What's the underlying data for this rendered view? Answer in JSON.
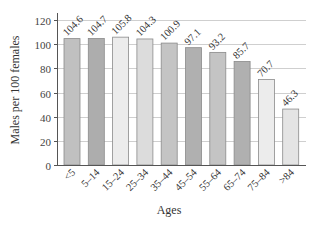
{
  "chart_data": {
    "type": "bar",
    "title": "",
    "xlabel": "Ages",
    "ylabel": "Males per 100 females",
    "ylim": [
      0,
      120
    ],
    "yticks": [
      0,
      20,
      40,
      60,
      80,
      100,
      120
    ],
    "grid": true,
    "legend": null,
    "categories": [
      "<5",
      "5–14",
      "15–24",
      "25–34",
      "35–44",
      "45–54",
      "55–64",
      "65–74",
      "75–84",
      ">84"
    ],
    "values": [
      104.6,
      104.7,
      105.8,
      104.3,
      100.9,
      97.1,
      93.2,
      85.7,
      70.7,
      46.3
    ],
    "value_labels": [
      "104.6",
      "104.7",
      "105.8",
      "104.3",
      "100.9",
      "97.1",
      "93.2",
      "85.7",
      "70.7",
      "46.3"
    ],
    "bar_colors": [
      "#c0c0c0",
      "#adadad",
      "#ececec",
      "#dcdcdc",
      "#c4c4c4",
      "#b0b0b0",
      "#c4c4c4",
      "#b0b0b0",
      "#ececec",
      "#e4e4e4"
    ]
  },
  "colors": {
    "gridline": "#cfcfcf",
    "axis": "#555555",
    "bar_border": "#8a8a8a"
  }
}
